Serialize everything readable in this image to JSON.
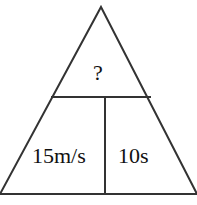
{
  "diagram": {
    "type": "formula-triangle",
    "top_label": "?",
    "bottom_left_label": "15m/s",
    "bottom_right_label": "10s",
    "stroke_color": "#333333"
  }
}
